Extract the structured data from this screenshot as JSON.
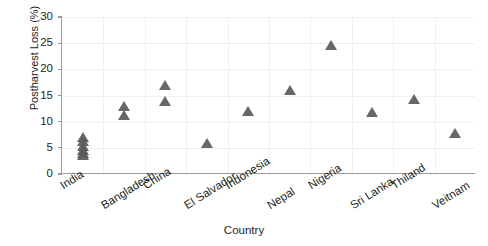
{
  "chart_data": {
    "type": "scatter",
    "title": "",
    "xlabel": "Country",
    "ylabel": "Postharvest Loss (%)",
    "ylim": [
      0,
      30
    ],
    "yticks": [
      0,
      5,
      10,
      15,
      20,
      25,
      30
    ],
    "grid": true,
    "legend": "none",
    "marker": "triangle-up",
    "marker_color": "#5a5a5a",
    "categories": [
      "India",
      "Bangladesh",
      "China",
      "El Salvador",
      "Indonesia",
      "Nepal",
      "Nigeria",
      "Sri Lanka",
      "Thiland",
      "Veitnam"
    ],
    "points": [
      {
        "category": "India",
        "values": [
          7.0,
          6.2,
          5.4,
          4.6,
          4.0,
          3.5
        ]
      },
      {
        "category": "Bangladesh",
        "values": [
          13.0,
          11.2
        ]
      },
      {
        "category": "China",
        "values": [
          17.0,
          14.0
        ]
      },
      {
        "category": "El Salvador",
        "values": [
          5.8
        ]
      },
      {
        "category": "Indonesia",
        "values": [
          12.0
        ]
      },
      {
        "category": "Nepal",
        "values": [
          16.0
        ]
      },
      {
        "category": "Nigeria",
        "values": [
          24.7
        ]
      },
      {
        "category": "Sri Lanka",
        "values": [
          11.8
        ]
      },
      {
        "category": "Thiland",
        "values": [
          14.3
        ]
      },
      {
        "category": "Veitnam",
        "values": [
          7.8
        ]
      }
    ]
  },
  "axis": {
    "y_title": "Postharvest Loss (%)",
    "x_title": "Country"
  }
}
